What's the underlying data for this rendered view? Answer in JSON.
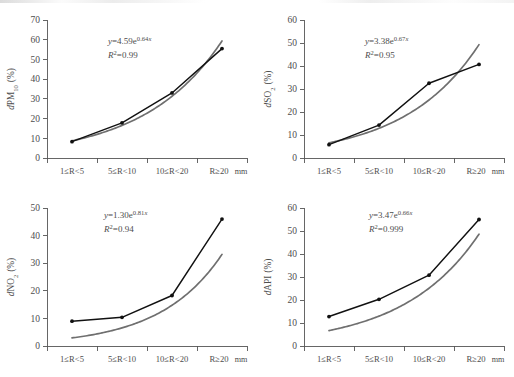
{
  "figure": {
    "type": "multi-panel-scatter-line",
    "panel_count": 4,
    "shared_x_categories": [
      "1≤R<5",
      "5≤R<10",
      "10≤R<20",
      "R≥20"
    ],
    "x_unit": "mm",
    "colors": {
      "observed_series": "#111111",
      "fitted_curve": "#6f6f6f",
      "axis": "#555555",
      "text": "#4d4d4d",
      "background": "#ffffff"
    }
  },
  "chart_data": [
    {
      "type": "line",
      "panel": "a",
      "title": "",
      "ylabel": "dPM10 (%)",
      "ylabel_parts": {
        "prefix": "d",
        "species": "PM",
        "subscript": "10",
        "unit": "(%)"
      },
      "xlabel": "",
      "x_unit": "mm",
      "categories": [
        "1≤R<5",
        "5≤R<10",
        "10≤R<20",
        "R≥20"
      ],
      "ylim": [
        0,
        70
      ],
      "yticks": [
        0,
        10,
        20,
        30,
        40,
        50,
        60,
        70
      ],
      "grid": false,
      "legend": "none",
      "series": [
        {
          "name": "observed",
          "values": [
            8.3,
            17.8,
            33.0,
            55.5
          ],
          "markers": true
        },
        {
          "name": "fitted",
          "values": [
            8.7,
            16.4,
            31.1,
            58.9
          ],
          "markers": false
        }
      ],
      "annotation": {
        "equation": "y=4.59e0.64x",
        "eq_coefficient": "4.59",
        "eq_exponent": "0.64",
        "r_squared": "R2=0.99",
        "r_squared_value": "0.99"
      }
    },
    {
      "type": "line",
      "panel": "b",
      "title": "",
      "ylabel": "dSO2 (%)",
      "ylabel_parts": {
        "prefix": "d",
        "species": "SO",
        "subscript": "2",
        "unit": "(%)"
      },
      "xlabel": "",
      "x_unit": "mm",
      "categories": [
        "1≤R<5",
        "5≤R<10",
        "10≤R<20",
        "R≥20"
      ],
      "ylim": [
        0,
        60
      ],
      "yticks": [
        0,
        10,
        20,
        30,
        40,
        50,
        60
      ],
      "grid": false,
      "legend": "none",
      "series": [
        {
          "name": "observed",
          "values": [
            5.8,
            14.3,
            32.5,
            40.7
          ],
          "markers": true
        },
        {
          "name": "fitted",
          "values": [
            6.6,
            12.9,
            25.2,
            49.3
          ],
          "markers": false
        }
      ],
      "annotation": {
        "equation": "y=3.38e0.67x",
        "eq_coefficient": "3.38",
        "eq_exponent": "0.67",
        "r_squared": "R2=0.95",
        "r_squared_value": "0.95"
      }
    },
    {
      "type": "line",
      "panel": "c",
      "title": "",
      "ylabel": "dNO2 (%)",
      "ylabel_parts": {
        "prefix": "d",
        "species": "NO",
        "subscript": "2",
        "unit": "(%)"
      },
      "xlabel": "",
      "x_unit": "mm",
      "categories": [
        "1≤R<5",
        "5≤R<10",
        "10≤R<20",
        "R≥20"
      ],
      "ylim": [
        0,
        50
      ],
      "yticks": [
        0,
        10,
        20,
        30,
        40,
        50
      ],
      "grid": false,
      "legend": "none",
      "series": [
        {
          "name": "observed",
          "values": [
            9.0,
            10.4,
            18.3,
            46.0
          ],
          "markers": true
        },
        {
          "name": "fitted",
          "values": [
            8.6,
            11.6,
            21.0,
            38.6
          ],
          "markers": false
        }
      ],
      "annotation": {
        "equation": "y=1.30e0.81x",
        "eq_coefficient": "1.30",
        "eq_exponent": "0.81",
        "r_squared": "R2=0.94",
        "r_squared_value": "0.94"
      }
    },
    {
      "type": "line",
      "panel": "d",
      "title": "",
      "ylabel": "dAPI (%)",
      "ylabel_parts": {
        "prefix": "d",
        "species": "API",
        "subscript": "",
        "unit": "(%)"
      },
      "xlabel": "",
      "x_unit": "mm",
      "categories": [
        "1≤R<5",
        "5≤R<10",
        "10≤R<20",
        "R≥20"
      ],
      "ylim": [
        0,
        60
      ],
      "yticks": [
        0,
        10,
        20,
        30,
        40,
        50,
        60
      ],
      "grid": false,
      "legend": "none",
      "series": [
        {
          "name": "observed",
          "values": [
            12.8,
            20.3,
            30.8,
            55.0
          ],
          "markers": true
        },
        {
          "name": "fitted",
          "values": [
            12.7,
            20.0,
            31.2,
            54.4
          ],
          "markers": false
        }
      ],
      "annotation": {
        "equation": "y=3.47e0.66x",
        "eq_coefficient": "3.47",
        "eq_exponent": "0.66",
        "r_squared": "R2=0.999",
        "r_squared_value": "0.999"
      }
    }
  ]
}
